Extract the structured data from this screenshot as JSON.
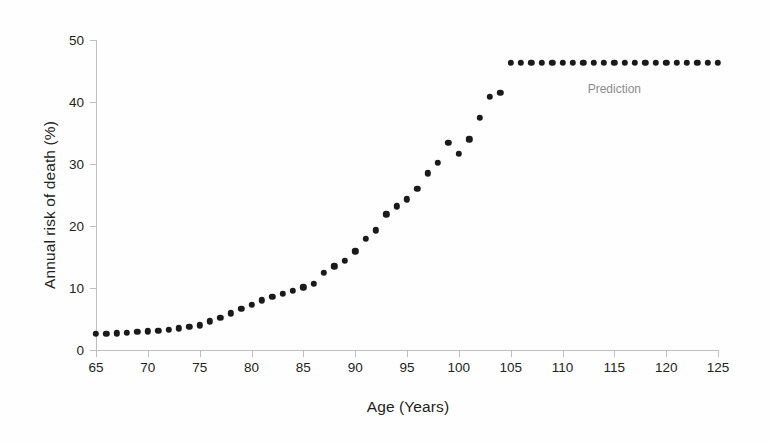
{
  "chart_data": {
    "type": "scatter",
    "title": "",
    "xlabel": "Age (Years)",
    "ylabel": "Annual risk of death (%)",
    "xlim": [
      65,
      125
    ],
    "ylim": [
      0,
      50
    ],
    "xticks": [
      65,
      70,
      75,
      80,
      85,
      90,
      95,
      100,
      105,
      110,
      115,
      120,
      125
    ],
    "yticks": [
      0,
      10,
      20,
      30,
      40,
      50
    ],
    "grid": false,
    "legend": null,
    "marker": {
      "shape": "circle",
      "color": "#1a1a1a",
      "size_px": 6.4
    },
    "annotations": [
      {
        "text": "Prediction",
        "x": 115,
        "y": 43.3,
        "color": "#8c8c8c"
      }
    ],
    "series": [
      {
        "name": "Annual risk of death",
        "x": [
          65,
          66,
          67,
          68,
          69,
          70,
          71,
          72,
          73,
          74,
          75,
          76,
          77,
          78,
          79,
          80,
          81,
          82,
          83,
          84,
          85,
          86,
          87,
          88,
          89,
          90,
          91,
          92,
          93,
          94,
          95,
          96,
          97,
          98,
          99,
          100,
          101,
          102,
          103,
          104,
          105,
          106,
          107,
          108,
          109,
          110,
          111,
          112,
          113,
          114,
          115,
          116,
          117,
          118,
          119,
          120,
          121,
          122,
          123,
          124,
          125
        ],
        "y": [
          2.6,
          2.6,
          2.7,
          2.8,
          2.9,
          3.0,
          3.1,
          3.3,
          3.5,
          3.7,
          4.0,
          4.6,
          5.2,
          5.9,
          6.6,
          7.3,
          8.0,
          8.6,
          9.1,
          9.5,
          10.1,
          10.7,
          12.5,
          13.5,
          14.4,
          15.9,
          17.9,
          19.3,
          21.9,
          23.2,
          24.3,
          26.0,
          28.5,
          30.2,
          33.4,
          31.6,
          34.0,
          37.5,
          40.8,
          41.5,
          46.3,
          46.3,
          46.3,
          46.3,
          46.3,
          46.3,
          46.3,
          46.3,
          46.3,
          46.3,
          46.3,
          46.3,
          46.3,
          46.3,
          46.3,
          46.3,
          46.3,
          46.3,
          46.3,
          46.3,
          46.3
        ]
      }
    ],
    "prediction_start_x": 105
  }
}
